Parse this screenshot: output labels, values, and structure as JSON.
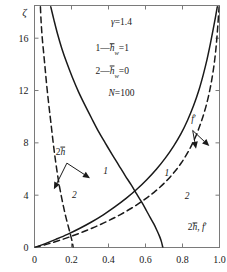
{
  "chart_data": {
    "type": "line",
    "title": "",
    "xlabel": "2h̄, f′",
    "ylabel": "ζ",
    "xlim": [
      0,
      1.0
    ],
    "ylim": [
      0,
      18.5
    ],
    "grid": false,
    "legend_position": "inside-top-center",
    "xticks": [
      "0",
      "0.2",
      "0.4",
      "0.6",
      "0.8",
      "1.0"
    ],
    "xtick_values": [
      0,
      0.2,
      0.4,
      0.6,
      0.8,
      1.0
    ],
    "yticks": [
      "0",
      "4",
      "8",
      "12",
      "16"
    ],
    "ytick_values": [
      0,
      4,
      8,
      12,
      16
    ],
    "annotations": [
      {
        "text": "γ=1.4",
        "x": 0.47,
        "y": 17.0
      },
      {
        "text": "1—h̄w=1",
        "x": 0.42,
        "y": 15.0
      },
      {
        "text": "2—h̄w=0",
        "x": 0.42,
        "y": 13.3
      },
      {
        "text": "N=100",
        "x": 0.47,
        "y": 11.6
      },
      {
        "text": "2h̄",
        "x": 0.14,
        "y": 7.1
      },
      {
        "text": "f′",
        "x": 0.86,
        "y": 9.6
      },
      {
        "text": "2h̄, f′",
        "x": 0.88,
        "y": 1.3
      }
    ],
    "curve_labels": [
      {
        "text": "1",
        "x": 0.385,
        "y": 5.6,
        "series": "2h-bar-hw1"
      },
      {
        "text": "2",
        "x": 0.215,
        "y": 3.8,
        "series": "2h-bar-hw0"
      },
      {
        "text": "1",
        "x": 0.715,
        "y": 5.5,
        "series": "fprime-hw1"
      },
      {
        "text": "2",
        "x": 0.825,
        "y": 3.7,
        "series": "fprime-hw0"
      }
    ],
    "series": [
      {
        "name": "2h̄, h̄w=1",
        "style": "solid",
        "label": "1",
        "points": [
          [
            0.088,
            18.4
          ],
          [
            0.105,
            17.4
          ],
          [
            0.125,
            16.3
          ],
          [
            0.148,
            15.2
          ],
          [
            0.175,
            14.1
          ],
          [
            0.205,
            13.0
          ],
          [
            0.238,
            11.9
          ],
          [
            0.272,
            10.9
          ],
          [
            0.308,
            9.9
          ],
          [
            0.345,
            8.9
          ],
          [
            0.382,
            8.0
          ],
          [
            0.42,
            7.1
          ],
          [
            0.455,
            6.3
          ],
          [
            0.49,
            5.5
          ],
          [
            0.522,
            4.8
          ],
          [
            0.552,
            4.1
          ],
          [
            0.578,
            3.5
          ],
          [
            0.602,
            2.9
          ],
          [
            0.625,
            2.3
          ],
          [
            0.645,
            1.8
          ],
          [
            0.662,
            1.3
          ],
          [
            0.676,
            0.85
          ],
          [
            0.686,
            0.45
          ],
          [
            0.692,
            0.1
          ],
          [
            0.694,
            0.0
          ]
        ]
      },
      {
        "name": "2h̄, h̄w=0",
        "style": "dashed",
        "label": "2",
        "points": [
          [
            0.032,
            18.4
          ],
          [
            0.036,
            17.2
          ],
          [
            0.042,
            16.0
          ],
          [
            0.05,
            14.8
          ],
          [
            0.058,
            13.6
          ],
          [
            0.066,
            12.4
          ],
          [
            0.075,
            11.2
          ],
          [
            0.084,
            10.1
          ],
          [
            0.093,
            9.0
          ],
          [
            0.102,
            7.9
          ],
          [
            0.111,
            6.9
          ],
          [
            0.121,
            5.9
          ],
          [
            0.132,
            4.9
          ],
          [
            0.144,
            4.0
          ],
          [
            0.157,
            3.1
          ],
          [
            0.17,
            2.3
          ],
          [
            0.183,
            1.6
          ],
          [
            0.194,
            1.0
          ],
          [
            0.202,
            0.55
          ],
          [
            0.207,
            0.2
          ],
          [
            0.209,
            0.0
          ]
        ]
      },
      {
        "name": "f′, h̄w=1",
        "style": "solid",
        "label": "1",
        "points": [
          [
            0.0,
            0.0
          ],
          [
            0.055,
            0.28
          ],
          [
            0.115,
            0.62
          ],
          [
            0.178,
            1.0
          ],
          [
            0.243,
            1.45
          ],
          [
            0.308,
            1.95
          ],
          [
            0.372,
            2.5
          ],
          [
            0.434,
            3.1
          ],
          [
            0.495,
            3.75
          ],
          [
            0.553,
            4.45
          ],
          [
            0.608,
            5.2
          ],
          [
            0.66,
            6.0
          ],
          [
            0.708,
            6.85
          ],
          [
            0.752,
            7.75
          ],
          [
            0.792,
            8.7
          ],
          [
            0.828,
            9.75
          ],
          [
            0.86,
            10.85
          ],
          [
            0.888,
            12.0
          ],
          [
            0.912,
            13.2
          ],
          [
            0.933,
            14.4
          ],
          [
            0.951,
            15.6
          ],
          [
            0.966,
            16.7
          ],
          [
            0.978,
            17.6
          ],
          [
            0.988,
            18.4
          ]
        ]
      },
      {
        "name": "f′, h̄w=0",
        "style": "dashed",
        "label": "2",
        "points": [
          [
            0.0,
            0.0
          ],
          [
            0.06,
            0.22
          ],
          [
            0.125,
            0.5
          ],
          [
            0.192,
            0.82
          ],
          [
            0.26,
            1.18
          ],
          [
            0.328,
            1.58
          ],
          [
            0.396,
            2.02
          ],
          [
            0.462,
            2.5
          ],
          [
            0.526,
            3.02
          ],
          [
            0.588,
            3.6
          ],
          [
            0.646,
            4.22
          ],
          [
            0.7,
            4.9
          ],
          [
            0.749,
            5.65
          ],
          [
            0.794,
            6.48
          ],
          [
            0.834,
            7.4
          ],
          [
            0.87,
            8.45
          ],
          [
            0.901,
            9.6
          ],
          [
            0.928,
            10.85
          ],
          [
            0.95,
            12.2
          ],
          [
            0.967,
            13.6
          ],
          [
            0.98,
            15.1
          ],
          [
            0.989,
            16.6
          ],
          [
            0.995,
            17.8
          ],
          [
            0.998,
            18.4
          ]
        ]
      }
    ],
    "arrows": [
      {
        "name": "arrow-2h-to-curve2",
        "from": [
          0.175,
          6.45
        ],
        "to": [
          0.105,
          4.45
        ]
      },
      {
        "name": "arrow-2h-to-curve1",
        "from": [
          0.175,
          6.45
        ],
        "to": [
          0.3,
          5.3
        ]
      },
      {
        "name": "arrow-fprime-to-curve1",
        "from": [
          0.855,
          8.95
        ],
        "to": [
          0.873,
          7.55
        ]
      },
      {
        "name": "arrow-fprime-to-curve2",
        "from": [
          0.855,
          8.95
        ],
        "to": [
          0.945,
          7.75
        ]
      }
    ],
    "colors": {
      "curve": "#1a1a1a",
      "axis": "#7a7a7a",
      "text": "#1a1a1a",
      "background": "#ffffff"
    }
  }
}
